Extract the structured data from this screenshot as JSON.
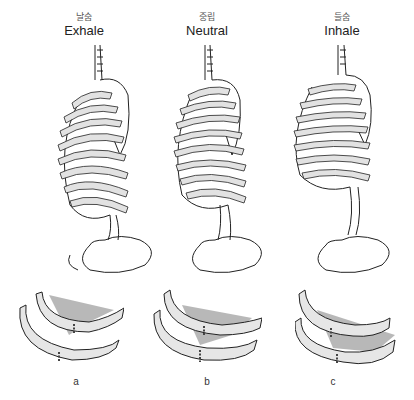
{
  "figure": {
    "columns": [
      {
        "korean": "날숨",
        "english": "Exhale",
        "panel": "a"
      },
      {
        "korean": "중립",
        "english": "Neutral",
        "panel": "b"
      },
      {
        "korean": "들숨",
        "english": "Inhale",
        "panel": "c"
      }
    ],
    "illustration_icons": [
      "ribcage-side-view-icon",
      "rib-pair-intercostal-detail-icon"
    ],
    "colors": {
      "line": "#222222",
      "bone_fill": "#e2e2e2",
      "muscle": "#9a9a9a",
      "background": "#ffffff"
    }
  }
}
